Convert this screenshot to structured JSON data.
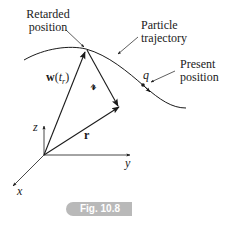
{
  "figure": {
    "caption_badge": "Fig. 10.8",
    "labels": {
      "retarded_position_line1": "Retarded",
      "retarded_position_line2": "position",
      "particle_trajectory_line1": "Particle",
      "particle_trajectory_line2": "trajectory",
      "present_position_line1": "Present",
      "present_position_line2": "position",
      "charge": "q",
      "w_vector_bold": "w",
      "w_vector_arg_open": "(",
      "w_vector_arg_t": "t",
      "w_vector_arg_sub": "r",
      "w_vector_arg_close": ")",
      "separation_vector": "𝓇",
      "position_vector": "r",
      "axis_x": "x",
      "axis_y": "y",
      "axis_z": "z"
    },
    "colors": {
      "ink": "#1a1a1a",
      "badge_bg": "#b9b9b9",
      "badge_text": "#ffffff"
    }
  }
}
